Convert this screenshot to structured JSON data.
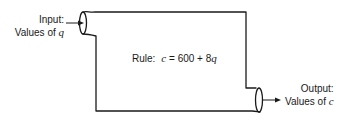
{
  "input": {
    "line1": "Input:",
    "line2_prefix": "Values of ",
    "variable": "q"
  },
  "rule": {
    "label": "Rule:",
    "lhs": "c",
    "equals": " = ",
    "constant": "600",
    "plus": " + ",
    "coefficient": "8",
    "variable": "q"
  },
  "output": {
    "line1": "Output:",
    "line2_prefix": "Values of ",
    "variable": "c"
  },
  "colors": {
    "stroke": "#1a1a1a",
    "background": "#ffffff"
  }
}
